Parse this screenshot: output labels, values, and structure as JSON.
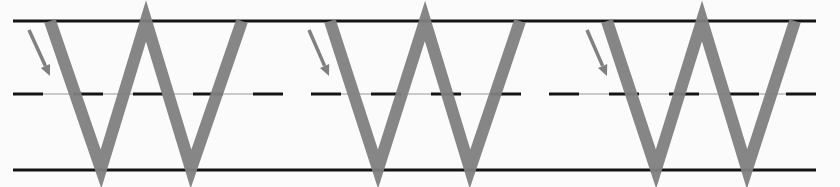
{
  "worksheet": {
    "letter": "W",
    "repetitions": 3,
    "colors": {
      "background": "#fbfbfb",
      "guide_line": "#141414",
      "midline_thin": "#9a9a9a",
      "letter_stroke": "#7f7f7f",
      "arrow": "#808080"
    },
    "guides": {
      "x_start": 13,
      "x_end": 816,
      "top_y": 21,
      "mid_y": 94,
      "bottom_y": 170,
      "dash_segments": [
        [
          13,
          43
        ],
        [
          73,
          103
        ],
        [
          133,
          163
        ],
        [
          193,
          223
        ],
        [
          253,
          283
        ],
        [
          311,
          341
        ],
        [
          371,
          401
        ],
        [
          431,
          461
        ],
        [
          491,
          521
        ],
        [
          549,
          579
        ],
        [
          609,
          639
        ],
        [
          669,
          699
        ],
        [
          729,
          759
        ],
        [
          786,
          816
        ]
      ],
      "thin_segments": [
        [
          43,
          253
        ],
        [
          341,
          521
        ],
        [
          579,
          786
        ]
      ]
    },
    "letters": [
      {
        "points": [
          [
            50,
            21
          ],
          [
            101,
            169
          ],
          [
            146,
            21
          ],
          [
            191,
            169
          ],
          [
            242,
            21
          ]
        ],
        "arrow": [
          [
            29,
            30
          ],
          [
            50,
            76
          ]
        ]
      },
      {
        "points": [
          [
            330,
            21
          ],
          [
            378,
            169
          ],
          [
            425,
            21
          ],
          [
            470,
            169
          ],
          [
            520,
            21
          ]
        ],
        "arrow": [
          [
            309,
            30
          ],
          [
            329,
            76
          ]
        ]
      },
      {
        "points": [
          [
            607,
            21
          ],
          [
            656,
            169
          ],
          [
            702,
            21
          ],
          [
            747,
            169
          ],
          [
            795,
            21
          ]
        ],
        "arrow": [
          [
            587,
            30
          ],
          [
            607,
            76
          ]
        ]
      }
    ]
  }
}
